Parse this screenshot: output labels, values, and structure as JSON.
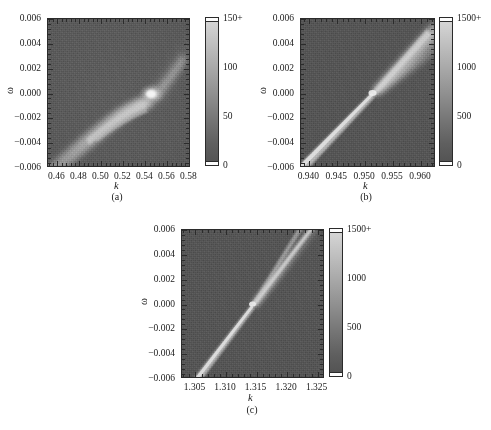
{
  "figure": {
    "type": "multi-panel-heatmap-figure",
    "panel_count": 3,
    "colormap": "grayscale",
    "background": "#ffffff"
  },
  "chart_data": [
    {
      "id": "panel-a",
      "type": "heatmap",
      "caption": "(a)",
      "title": "",
      "xlabel": "k",
      "ylabel": "ω",
      "xlim": [
        0.4515,
        0.5815
      ],
      "ylim": [
        -0.006,
        0.006
      ],
      "xticks": [
        0.46,
        0.48,
        0.5,
        0.52,
        0.54,
        0.56,
        0.58
      ],
      "xticklabels": [
        "0.46",
        "0.48",
        "0.50",
        "0.52",
        "0.54",
        "0.56",
        "0.58"
      ],
      "yticks": [
        0.006,
        0.004,
        0.002,
        0.0,
        -0.002,
        -0.004,
        -0.006
      ],
      "yticklabels": [
        "0.006",
        "0.004",
        "0.002",
        "0.000",
        "−0.002",
        "−0.004",
        "−0.006"
      ],
      "colorbar": {
        "ticks": [
          150,
          100,
          50,
          0
        ],
        "ticklabels": [
          "150+",
          "100",
          "50",
          "0"
        ],
        "vmin": 0,
        "vmax": 150,
        "over_marker": "+"
      },
      "features": [
        {
          "name": "bright-ridge-lower-left",
          "description": "broad bright band sweeping from lower-left toward center",
          "k_range": [
            0.46,
            0.53
          ],
          "omega_range": [
            -0.006,
            0.0
          ]
        },
        {
          "name": "fork-branch",
          "description": "secondary narrow branch splitting below the main ridge",
          "k_range": [
            0.495,
            0.532
          ],
          "omega_range": [
            -0.0018,
            -0.0002
          ]
        },
        {
          "name": "bright-knot",
          "description": "brightest concentrated spot near crossing point",
          "k": 0.533,
          "omega": 0.0003
        },
        {
          "name": "upper-right-plume",
          "description": "faint diffuse plume extending up-right from the knot",
          "k_range": [
            0.533,
            0.572
          ],
          "omega_range": [
            0.0,
            0.006
          ]
        }
      ],
      "background_level": 28,
      "noise": true
    },
    {
      "id": "panel-b",
      "type": "heatmap",
      "caption": "(b)",
      "title": "",
      "xlabel": "k",
      "ylabel": "ω",
      "xlim": [
        0.9385,
        0.9627
      ],
      "ylim": [
        -0.006,
        0.006
      ],
      "xticks": [
        0.94,
        0.945,
        0.95,
        0.955,
        0.96
      ],
      "xticklabels": [
        "0.940",
        "0.945",
        "0.950",
        "0.955",
        "0.960"
      ],
      "yticks": [
        0.006,
        0.004,
        0.002,
        0.0,
        -0.002,
        -0.004,
        -0.006
      ],
      "yticklabels": [
        "0.006",
        "0.004",
        "0.002",
        "0.000",
        "−0.002",
        "−0.004",
        "−0.006"
      ],
      "colorbar": {
        "ticks": [
          1500,
          1000,
          500,
          0
        ],
        "ticklabels": [
          "1500+",
          "1000",
          "500",
          "0"
        ],
        "vmin": 0,
        "vmax": 1500,
        "over_marker": "+"
      },
      "features": [
        {
          "name": "diagonal-ridge",
          "description": "thin bright diagonal line crossing the panel",
          "k_range": [
            0.9385,
            0.9627
          ],
          "omega_range": [
            -0.006,
            0.006
          ]
        },
        {
          "name": "crossing-point",
          "description": "narrow waist where the ridge is thinnest",
          "k": 0.9515,
          "omega": 0.0
        },
        {
          "name": "upper-cone",
          "description": "ridge broadens into a diffuse cone above omega = 0",
          "k_range": [
            0.9515,
            0.9627
          ],
          "omega_range": [
            0.0,
            0.006
          ]
        }
      ],
      "background_level": 300,
      "noise": true
    },
    {
      "id": "panel-c",
      "type": "heatmap",
      "caption": "(c)",
      "title": "",
      "xlabel": "k",
      "ylabel": "ω",
      "xlim": [
        1.3028,
        1.3262
      ],
      "ylim": [
        -0.006,
        0.006
      ],
      "xticks": [
        1.305,
        1.31,
        1.315,
        1.32,
        1.325
      ],
      "xticklabels": [
        "1.305",
        "1.310",
        "1.315",
        "1.320",
        "1.325"
      ],
      "yticks": [
        0.006,
        0.004,
        0.002,
        0.0,
        -0.002,
        -0.004,
        -0.006
      ],
      "yticklabels": [
        "0.006",
        "0.004",
        "0.002",
        "0.000",
        "−0.002",
        "−0.004",
        "−0.006"
      ],
      "colorbar": {
        "ticks": [
          1500,
          1000,
          500,
          0
        ],
        "ticklabels": [
          "1500+",
          "1000",
          "500",
          "0"
        ],
        "vmin": 0,
        "vmax": 1500,
        "over_marker": "+"
      },
      "features": [
        {
          "name": "diagonal-ridge",
          "description": "narrow bright diagonal ridge across the panel",
          "k_range": [
            1.3028,
            1.3262
          ],
          "omega_range": [
            -0.006,
            0.006
          ]
        },
        {
          "name": "crossing-point",
          "description": "waist of the ridge at omega = 0",
          "k": 1.315,
          "omega": 0.0
        },
        {
          "name": "upper-split",
          "description": "ridge splits into two bright branches above omega = 0",
          "k_range": [
            1.315,
            1.3262
          ],
          "omega_range": [
            0.0,
            0.006
          ]
        }
      ],
      "background_level": 300,
      "noise": true
    }
  ],
  "panels": {
    "a": {
      "caption": "(a)",
      "xlabel": "k",
      "ylabel": "ω",
      "xticklabels": [
        "0.46",
        "0.48",
        "0.50",
        "0.52",
        "0.54",
        "0.56",
        "0.58"
      ],
      "yticklabels": [
        "0.006",
        "0.004",
        "0.002",
        "0.000",
        "−0.002",
        "−0.004",
        "−0.006"
      ],
      "cbarlabels": [
        "150+",
        "100",
        "50",
        "0"
      ]
    },
    "b": {
      "caption": "(b)",
      "xlabel": "k",
      "ylabel": "ω",
      "xticklabels": [
        "0.940",
        "0.945",
        "0.950",
        "0.955",
        "0.960"
      ],
      "yticklabels": [
        "0.006",
        "0.004",
        "0.002",
        "0.000",
        "−0.002",
        "−0.004",
        "−0.006"
      ],
      "cbarlabels": [
        "1500+",
        "1000",
        "500",
        "0"
      ]
    },
    "c": {
      "caption": "(c)",
      "xlabel": "k",
      "ylabel": "ω",
      "xticklabels": [
        "1.305",
        "1.310",
        "1.315",
        "1.320",
        "1.325"
      ],
      "yticklabels": [
        "0.006",
        "0.004",
        "0.002",
        "0.000",
        "−0.002",
        "−0.004",
        "−0.006"
      ],
      "cbarlabels": [
        "1500+",
        "1000",
        "500",
        "0"
      ]
    }
  }
}
